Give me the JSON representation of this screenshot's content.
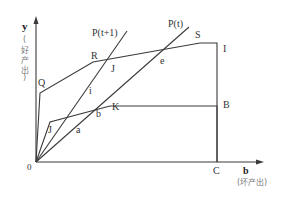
{
  "diagram": {
    "axes": {
      "y_label": "y",
      "y_sublabel": [
        "(",
        "好",
        "产",
        "出",
        ")"
      ],
      "x_label": "b",
      "x_sublabel": "(坏产出)",
      "origin_label": "0"
    },
    "points": {
      "Q": "Q",
      "R": "R",
      "S": "S",
      "I": "I",
      "J_upper": "J",
      "e": "e",
      "i": "i",
      "K": "K",
      "B": "B",
      "b": "b",
      "a": "a",
      "J_lower": "J",
      "C": "C"
    },
    "rays": {
      "p_t1": "P(t+1)",
      "p_t": "P(t)"
    },
    "colors": {
      "line": "#3a3a3a",
      "text": "#333333",
      "background": "#ffffff"
    }
  }
}
